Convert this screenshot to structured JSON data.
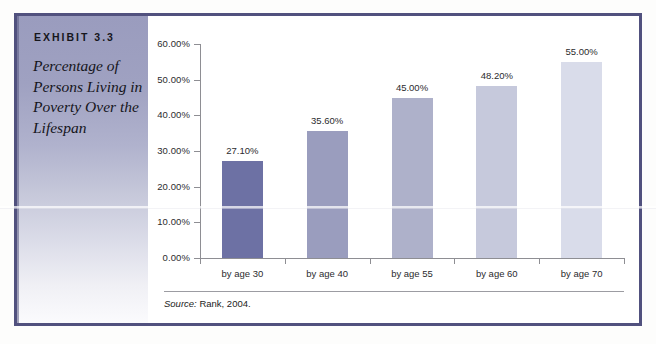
{
  "exhibit": {
    "label": "EXHIBIT 3.3",
    "caption": "Percentage of Persons Living in Poverty Over the Lifespan"
  },
  "source": {
    "prefix": "Source:",
    "text": "Rank, 2004."
  },
  "colors": {
    "frame": "#51517e",
    "sidebar_top": "#9a9cbe",
    "sidebar_bottom": "#fbfbfd",
    "axis": "#8e8e93",
    "text": "#2b2b2e"
  },
  "chart_data": {
    "type": "bar",
    "title": "Percentage of Persons Living in Poverty Over the Lifespan",
    "xlabel": "",
    "ylabel": "",
    "categories": [
      "by age 30",
      "by age 40",
      "by age 55",
      "by age 60",
      "by age 70"
    ],
    "values": [
      27.1,
      35.6,
      45.0,
      48.2,
      55.0
    ],
    "value_labels": [
      "27.10%",
      "35.60%",
      "45.00%",
      "48.20%",
      "55.00%"
    ],
    "bar_colors": [
      "#6d71a4",
      "#9a9dbe",
      "#aeb1ca",
      "#c6c9dc",
      "#d9dcea"
    ],
    "ylim": [
      0,
      60
    ],
    "ytick_values": [
      0,
      10,
      20,
      30,
      40,
      50,
      60
    ],
    "ytick_labels": [
      "0.00%",
      "10.00%",
      "20.00%",
      "30.00%",
      "40.00%",
      "50.00%",
      "60.00%"
    ],
    "grid": false,
    "legend": false
  }
}
